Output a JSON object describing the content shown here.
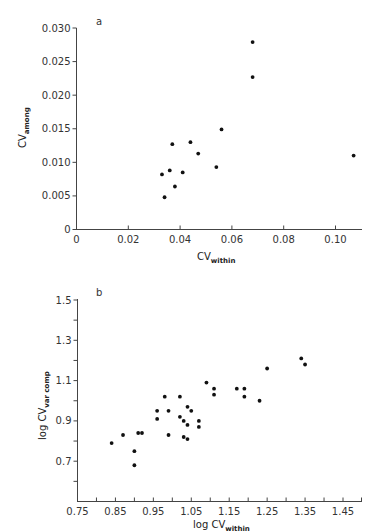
{
  "chart_data": [
    {
      "panel": "a",
      "type": "scatter",
      "title": "",
      "xlabel": "CV",
      "xlabel_sub": "within",
      "ylabel": "CV",
      "ylabel_sub": "among",
      "xlim": [
        0,
        0.11
      ],
      "ylim": [
        0,
        0.03
      ],
      "xticks": [
        "0",
        "0.02",
        "0.04",
        "0.06",
        "0.08",
        "0.10"
      ],
      "yticks": [
        "0",
        "0.005",
        "0.010",
        "0.015",
        "0.020",
        "0.025",
        "0.030"
      ],
      "grid": false,
      "points": [
        {
          "x": 0.068,
          "y": 0.0279
        },
        {
          "x": 0.068,
          "y": 0.0227
        },
        {
          "x": 0.056,
          "y": 0.0149
        },
        {
          "x": 0.107,
          "y": 0.011
        },
        {
          "x": 0.044,
          "y": 0.013
        },
        {
          "x": 0.037,
          "y": 0.0127
        },
        {
          "x": 0.047,
          "y": 0.0113
        },
        {
          "x": 0.054,
          "y": 0.0093
        },
        {
          "x": 0.036,
          "y": 0.0088
        },
        {
          "x": 0.041,
          "y": 0.0085
        },
        {
          "x": 0.033,
          "y": 0.0082
        },
        {
          "x": 0.038,
          "y": 0.0064
        },
        {
          "x": 0.034,
          "y": 0.0048
        }
      ]
    },
    {
      "panel": "b",
      "type": "scatter",
      "title": "",
      "xlabel": "log  CV",
      "xlabel_sub": "within",
      "ylabel": "log  CV",
      "ylabel_sub": "var comp",
      "xlim": [
        0.75,
        1.5
      ],
      "ylim": [
        0.5,
        1.5
      ],
      "xticks": [
        "0.75",
        "0.85",
        "0.95",
        "1.05",
        "1.15",
        "1.25",
        "1.35",
        "1.45"
      ],
      "yticks": [
        "0.7",
        "0.9",
        "1.1",
        "1.3",
        "1.5"
      ],
      "grid": false,
      "points": [
        {
          "x": 1.34,
          "y": 1.21
        },
        {
          "x": 1.35,
          "y": 1.18
        },
        {
          "x": 1.25,
          "y": 1.16
        },
        {
          "x": 1.09,
          "y": 1.09
        },
        {
          "x": 1.11,
          "y": 1.06
        },
        {
          "x": 1.11,
          "y": 1.03
        },
        {
          "x": 1.17,
          "y": 1.06
        },
        {
          "x": 1.19,
          "y": 1.06
        },
        {
          "x": 1.19,
          "y": 1.02
        },
        {
          "x": 1.23,
          "y": 1.0
        },
        {
          "x": 0.98,
          "y": 1.02
        },
        {
          "x": 1.02,
          "y": 1.02
        },
        {
          "x": 1.04,
          "y": 0.97
        },
        {
          "x": 1.05,
          "y": 0.95
        },
        {
          "x": 0.96,
          "y": 0.95
        },
        {
          "x": 0.99,
          "y": 0.95
        },
        {
          "x": 0.96,
          "y": 0.91
        },
        {
          "x": 1.02,
          "y": 0.92
        },
        {
          "x": 1.03,
          "y": 0.9
        },
        {
          "x": 1.04,
          "y": 0.88
        },
        {
          "x": 1.07,
          "y": 0.9
        },
        {
          "x": 1.07,
          "y": 0.87
        },
        {
          "x": 0.99,
          "y": 0.83
        },
        {
          "x": 1.03,
          "y": 0.82
        },
        {
          "x": 1.04,
          "y": 0.81
        },
        {
          "x": 0.84,
          "y": 0.79
        },
        {
          "x": 0.87,
          "y": 0.83
        },
        {
          "x": 0.91,
          "y": 0.84
        },
        {
          "x": 0.92,
          "y": 0.84
        },
        {
          "x": 0.9,
          "y": 0.75
        },
        {
          "x": 0.9,
          "y": 0.68
        }
      ]
    }
  ]
}
